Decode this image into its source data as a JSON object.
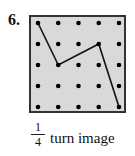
{
  "problem": {
    "number": "6.",
    "caption": {
      "fraction": {
        "numerator": "1",
        "denominator": "4"
      },
      "text": "turn image"
    }
  },
  "geoboard": {
    "rows": 5,
    "cols": 5,
    "background": "#d9d9d9",
    "border_color": "#333333",
    "dot_color": "#000000",
    "path_color": "#111111",
    "path_points": [
      [
        0,
        0
      ],
      [
        1,
        2
      ],
      [
        3,
        1
      ],
      [
        4,
        4
      ]
    ]
  }
}
